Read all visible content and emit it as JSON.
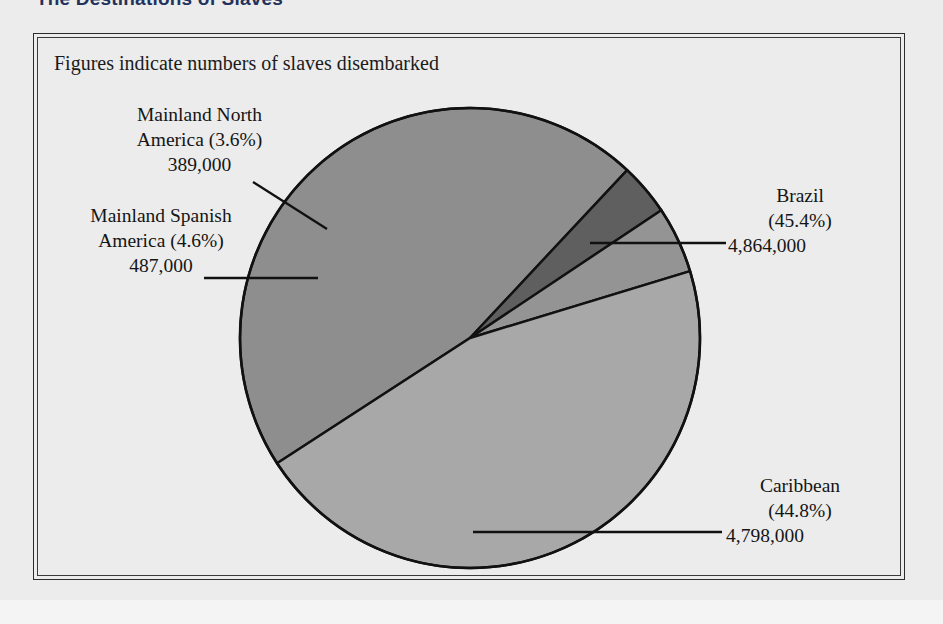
{
  "header": {
    "title": "The Destinations of Slaves"
  },
  "figure": {
    "caption": "Figures indicate numbers of slaves disembarked"
  },
  "chart_data": {
    "type": "pie",
    "title": "The Destinations of Slaves",
    "subtitle": "Figures indicate numbers of slaves disembarked",
    "unit": "slaves disembarked",
    "total": 10538000,
    "legend": "none",
    "labels": [
      "Brazil",
      "Caribbean",
      "Mainland Spanish America",
      "Mainland North America"
    ],
    "values": [
      4864000,
      4798000,
      487000,
      389000
    ],
    "percentages": [
      45.4,
      44.8,
      4.6,
      3.6
    ],
    "slices": [
      {
        "name": "Brazil",
        "percent": 45.4,
        "percent_text": "(45.4%)",
        "value": 4864000,
        "value_text": "4,864,000",
        "color": "#8e8e8e"
      },
      {
        "name": "Mainland North America",
        "percent": 3.6,
        "percent_text": "(3.6%)",
        "value": 389000,
        "value_text": "389,000",
        "color": "#5f5f5f"
      },
      {
        "name": "Mainland Spanish America",
        "percent": 4.6,
        "percent_text": "(4.6%)",
        "value": 487000,
        "value_text": "487,000",
        "color": "#949494"
      },
      {
        "name": "Caribbean",
        "percent": 44.8,
        "percent_text": "(44.8%)",
        "value": 4798000,
        "value_text": "4,798,000",
        "color": "#a8a8a8"
      }
    ]
  },
  "labels": {
    "mainland_north_america": {
      "line1": "Mainland North",
      "line2": "America (3.6%)",
      "line3": "389,000"
    },
    "mainland_spanish_america": {
      "line1": "Mainland Spanish",
      "line2": "America (4.6%)",
      "line3": "487,000"
    },
    "brazil": {
      "line1": "Brazil",
      "line2": "(45.4%)",
      "line3": "4,864,000"
    },
    "caribbean": {
      "line1": "Caribbean",
      "line2": "(44.8%)",
      "line3": "4,798,000"
    }
  },
  "colors": {
    "page_background": "#ececec",
    "frame_line": "#2b2b2b",
    "text": "#151515",
    "title": "#23325c",
    "pie_outline": "#111111",
    "brazil": "#8e8e8e",
    "caribbean": "#a8a8a8",
    "mainland_spanish_america": "#949494",
    "mainland_north_america": "#5f5f5f"
  }
}
